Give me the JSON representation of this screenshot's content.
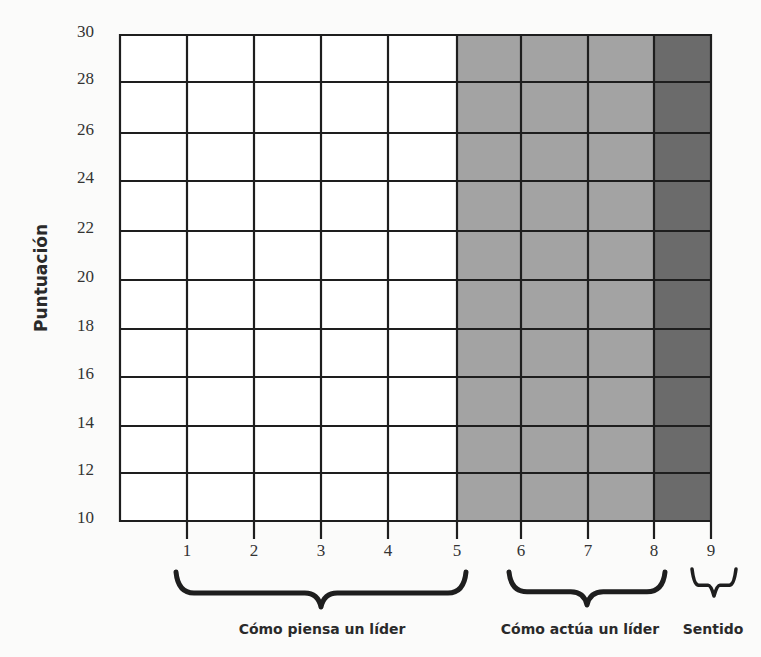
{
  "chart_data": {
    "type": "table",
    "title": "",
    "xlabel": "",
    "ylabel": "Puntuación",
    "ylim": [
      10,
      30
    ],
    "yticks": [
      10,
      12,
      14,
      16,
      18,
      20,
      22,
      24,
      26,
      28,
      30
    ],
    "xticks": [
      1,
      2,
      3,
      4,
      5,
      6,
      7,
      8,
      9
    ],
    "grid": true,
    "legend": null,
    "series": [],
    "regions": [
      {
        "name": "Cómo piensa un líder",
        "x_start": 0,
        "x_end": 5,
        "color": "#ffffff"
      },
      {
        "name": "Cómo actúa un líder",
        "x_start": 5,
        "x_end": 8,
        "color": "#a3a3a3"
      },
      {
        "name": "Sentido",
        "x_start": 8,
        "x_end": 9,
        "color": "#6b6b6b"
      }
    ],
    "groups": [
      {
        "label": "Cómo piensa un líder",
        "columns": [
          1,
          2,
          3,
          4,
          5
        ]
      },
      {
        "label": "Cómo actúa un líder",
        "columns": [
          6,
          7,
          8
        ]
      },
      {
        "label": "Sentido",
        "columns": [
          9
        ]
      }
    ],
    "note": "Blank score grid — no data values plotted"
  },
  "colors": {
    "region_white": "#ffffff",
    "region_light_gray": "#a3a3a3",
    "region_dark_gray": "#6b6b6b",
    "grid": "#1e1e1e"
  }
}
